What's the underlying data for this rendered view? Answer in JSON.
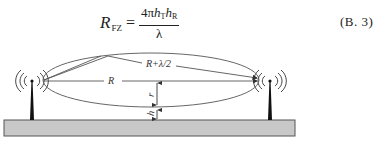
{
  "formula": {
    "lhs_symbol": "R",
    "lhs_subscript": "FZ",
    "equals": "=",
    "numerator_prefix": "4π",
    "numerator_h1": "h",
    "numerator_h1_sub": "T",
    "numerator_h2": "h",
    "numerator_h2_sub": "R",
    "denominator": "λ",
    "equation_number": "(B. 3)"
  },
  "diagram": {
    "labels": {
      "reflected_path": "R+λ/2",
      "direct_path": "R",
      "zone_radius": "r",
      "clearance_height": "h"
    },
    "colors": {
      "ground_fill": "#c8c8c8",
      "ground_stroke": "#555555",
      "line": "#444444",
      "antenna": "#111111"
    }
  }
}
